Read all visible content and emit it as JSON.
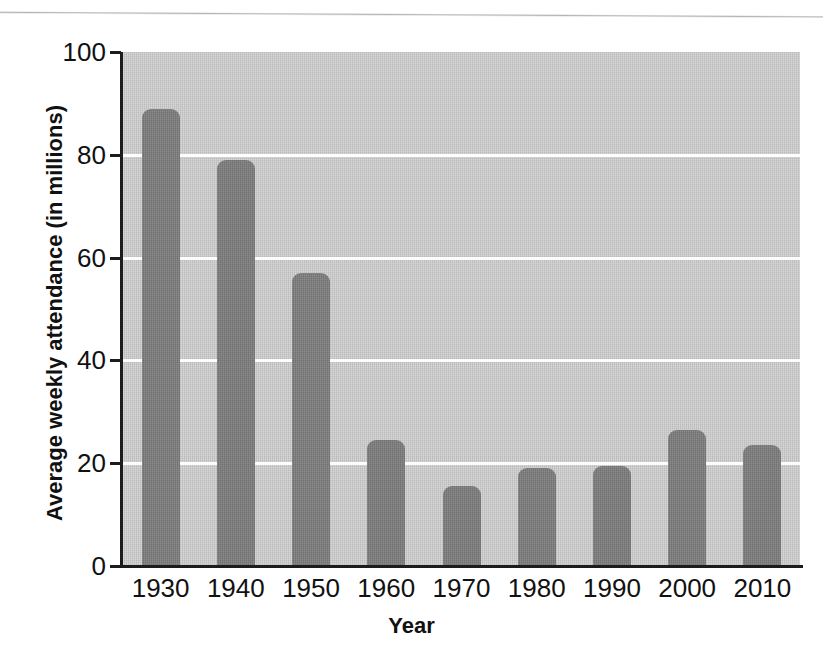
{
  "chart_data": {
    "type": "bar",
    "title": "",
    "subtitle": "",
    "xlabel": "Year",
    "ylabel": "Average weekly attendance (in millions)",
    "categories": [
      "1930",
      "1940",
      "1950",
      "1960",
      "1970",
      "1980",
      "1990",
      "2000",
      "2010"
    ],
    "values": [
      89,
      79,
      57,
      24.5,
      15.5,
      19,
      19.5,
      26.5,
      23.5
    ],
    "ylim": [
      0,
      100
    ],
    "yticks": [
      0,
      20,
      40,
      60,
      80,
      100
    ],
    "ytick_labels": [
      "0",
      "20",
      "40",
      "60",
      "80",
      "100"
    ],
    "xtick_labels": [
      "1930",
      "1940",
      "1950",
      "1960",
      "1970",
      "1980",
      "1990",
      "2000",
      "2010"
    ],
    "grid": "horizontal",
    "gridline_values": [
      20,
      40,
      60,
      80
    ],
    "legend": "none",
    "series": [
      {
        "name": "Average weekly attendance",
        "values": [
          89,
          79,
          57,
          24.5,
          15.5,
          19,
          19.5,
          26.5,
          23.5
        ]
      }
    ],
    "annotations": []
  },
  "style": {
    "bar_color": "#7c7c7c",
    "plot_background": "#c9c9c9",
    "gridline_color": "#fdfdfd",
    "axis_color": "#1c1c1c",
    "text_color": "#111111",
    "page_background": "#ffffff"
  },
  "figure": {
    "y_axis_title": "Average weekly attendance (in millions)",
    "x_axis_title": "Year"
  }
}
